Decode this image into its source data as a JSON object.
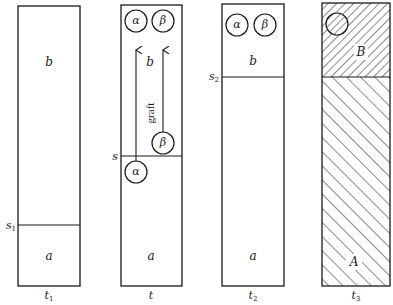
{
  "diagram": {
    "ink_color": "#1a1a1a",
    "background": "#ffffff",
    "panels": [
      {
        "id": "t1",
        "time_label": "t",
        "time_sub": "1",
        "boundary_label": "s",
        "boundary_sub": "1",
        "upper_region": "b",
        "lower_region": "a"
      },
      {
        "id": "t",
        "time_label": "t",
        "time_sub": "",
        "boundary_label": "s",
        "boundary_sub": "",
        "upper_region": "b",
        "lower_region": "a",
        "circles_top": [
          "α",
          "β"
        ],
        "circle_beta_source": "β",
        "circle_alpha_source": "α",
        "arrow_label": "graft"
      },
      {
        "id": "t2",
        "time_label": "t",
        "time_sub": "2",
        "boundary_label": "s",
        "boundary_sub": "2",
        "upper_region": "b",
        "lower_region": "a",
        "circles_top": [
          "α",
          "β"
        ]
      },
      {
        "id": "t3",
        "time_label": "t",
        "time_sub": "3",
        "upper_region": "B",
        "lower_region": "A",
        "hatching": {
          "upper": "fine diagonal ascending",
          "lower": "wide diagonal descending",
          "circle": "diagonal ascending"
        }
      }
    ]
  }
}
